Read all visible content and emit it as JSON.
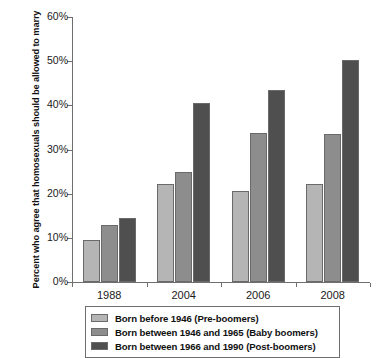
{
  "chart_data": {
    "type": "bar",
    "title": "",
    "subtitle": "",
    "xlabel": "",
    "ylabel": "Percent who agree that homosexuals should be allowed to marry",
    "categories": [
      "1988",
      "2004",
      "2006",
      "2008"
    ],
    "series": [
      {
        "name": "Born before 1946 (Pre-boomers)",
        "color": "#b5b5b5",
        "values": [
          9.5,
          22.1,
          20.6,
          22.2
        ]
      },
      {
        "name": "Born between 1946 and 1965 (Baby boomers)",
        "color": "#8d8d8d",
        "values": [
          12.8,
          25.0,
          33.7,
          33.5
        ]
      },
      {
        "name": "Born between 1966 and 1990 (Post-boomers)",
        "color": "#4f4f4f",
        "values": [
          14.6,
          40.5,
          43.4,
          50.3
        ]
      }
    ],
    "ylim": [
      0,
      60
    ],
    "yticks": [
      0,
      10,
      20,
      30,
      40,
      50,
      60
    ],
    "ytick_labels": [
      "0%",
      "10%",
      "20%",
      "30%",
      "40%",
      "50%",
      "60%"
    ],
    "grid": false,
    "legend_position": "bottom",
    "legend_box": true
  },
  "axis": {
    "y_title": "Percent who agree that homosexuals should be allowed to marry",
    "y_title_line1": "Percent who agree that homosexuals should be",
    "y_title_line2": "allowed to marry"
  }
}
